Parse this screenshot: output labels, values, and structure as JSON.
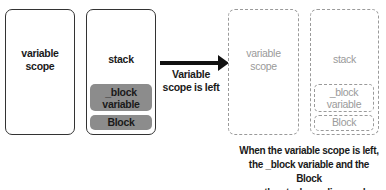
{
  "before": {
    "variable_scope_box": {
      "label_line1": "variable",
      "label_line2": "scope"
    },
    "stack_box": {
      "label": "stack",
      "items": [
        {
          "line1": "_block",
          "line2": "variable"
        },
        {
          "line1": "Block"
        }
      ]
    }
  },
  "transition": {
    "label_line1": "Variable",
    "label_line2": "scope is left"
  },
  "after": {
    "variable_scope_box": {
      "label_line1": "variable",
      "label_line2": "scope"
    },
    "stack_box": {
      "label": "stack",
      "items": [
        {
          "line1": "_block",
          "line2": "variable"
        },
        {
          "line1": "Block"
        }
      ]
    }
  },
  "caption": {
    "line1": "When the variable scope is left,",
    "line2": "the _block variable and the Block",
    "line3": "on the stack are disposed."
  },
  "colors": {
    "solid_border": "#333333",
    "dashed_border": "#9a9a9a",
    "pill_fill": "#8c8c8c",
    "arrow": "#111111"
  }
}
